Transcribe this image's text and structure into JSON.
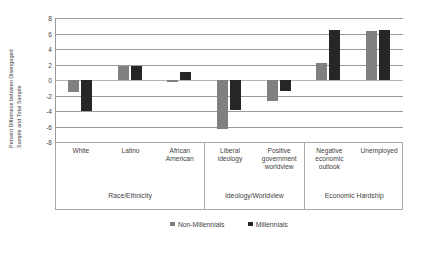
{
  "chart_data": {
    "type": "bar",
    "title": "",
    "subtitle": "",
    "xlabel": "",
    "ylabel": "Percent Differnece between Disengaged Sample and Total Sample",
    "ylabel_line1": "Percent Differnece between Disengaged",
    "ylabel_line2": "Sample and Total Sample",
    "ylim": [
      -8,
      8
    ],
    "yticks": [
      8,
      6,
      4,
      2,
      0,
      -2,
      -4,
      -6,
      -8
    ],
    "ytick_labels": [
      "8",
      "6",
      "4",
      "2",
      "0",
      "-2",
      "-4",
      "-6",
      "-8"
    ],
    "grid": true,
    "legend_position": "bottom",
    "categories": [
      "White",
      "Latino",
      "African American",
      "Liberal ideology",
      "Positive government worldview",
      "Negative economic outlook",
      "Unemployed"
    ],
    "category_lines": [
      [
        "White"
      ],
      [
        "Latino"
      ],
      [
        "African",
        "American"
      ],
      [
        "Liberal",
        "ideology"
      ],
      [
        "Positive",
        "government",
        "worldview"
      ],
      [
        "Negative",
        "economic",
        "outlook"
      ],
      [
        "Unemployed"
      ]
    ],
    "groups": [
      {
        "label": "Race/Ethnicity",
        "span": 3
      },
      {
        "label": "Ideology/Worldview",
        "span": 2
      },
      {
        "label": "Economic Hardship",
        "span": 2
      }
    ],
    "series": [
      {
        "name": "Non-Millennials",
        "color": "#808080",
        "values": [
          -1.5,
          1.8,
          -0.2,
          -6.3,
          -2.7,
          2.2,
          6.3
        ]
      },
      {
        "name": "Millennials",
        "color": "#262626",
        "values": [
          -4.0,
          1.8,
          1.0,
          -3.9,
          -1.4,
          6.4,
          6.4
        ]
      }
    ]
  },
  "legend": {
    "items": [
      {
        "label": "Non-Millennials",
        "color": "#808080"
      },
      {
        "label": "Millennials",
        "color": "#262626"
      }
    ]
  },
  "colors": {
    "non_millennials": "#808080",
    "millennials": "#262626",
    "gridline": "#9a9a9a",
    "border": "#a8a8a8",
    "text": "#3f3f3f",
    "background": "#ffffff"
  }
}
